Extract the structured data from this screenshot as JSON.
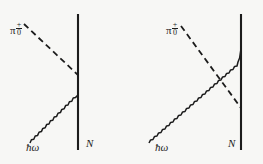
{
  "figure": {
    "background_color": "#f7f7f5",
    "ink_color": "#1c1c1c",
    "width": 263,
    "height": 164
  },
  "diagrams": [
    {
      "id": "left",
      "name": "direct-diagram",
      "labels": {
        "pion": {
          "glyph": "π",
          "charge_superscript": "+",
          "charge_subscript": "0",
          "x": 10,
          "y": 22
        },
        "photon": {
          "text": "ħω",
          "x": 26,
          "y": 142
        },
        "nucleon": {
          "text": "N",
          "x": 86,
          "y": 138
        }
      },
      "lines": {
        "nucleon_line": {
          "x": 78,
          "y1": 14,
          "y2": 150
        },
        "pion_dashed": {
          "x1": 24,
          "y1": 24,
          "x2": 78,
          "y2": 75
        },
        "photon_wavy": {
          "x1": 30,
          "y1": 143,
          "x2": 78,
          "y2": 95
        }
      },
      "vertices": [
        {
          "x": 78,
          "y": 75,
          "type": "pion-vertex"
        },
        {
          "x": 78,
          "y": 95,
          "type": "photon-vertex"
        }
      ]
    },
    {
      "id": "right",
      "name": "crossed-diagram",
      "labels": {
        "pion": {
          "glyph": "π",
          "charge_superscript": "+",
          "charge_subscript": "0",
          "x": 35,
          "y": 22
        },
        "photon": {
          "text": "ħω",
          "x": 24,
          "y": 142
        },
        "nucleon": {
          "text": "N",
          "x": 97,
          "y": 138
        }
      },
      "lines": {
        "nucleon_line": {
          "x": 110,
          "y1": 14,
          "y2": 150
        },
        "pion_dashed": {
          "x1": 50,
          "y1": 26,
          "x2": 110,
          "y2": 108
        },
        "photon_wavy": {
          "x1": 18,
          "y1": 143,
          "x2": 110,
          "y2": 46
        }
      },
      "vertices": [
        {
          "x": 110,
          "y": 46,
          "type": "photon-vertex"
        },
        {
          "x": 110,
          "y": 108,
          "type": "pion-vertex"
        }
      ],
      "crossing_point": {
        "x": 64,
        "y": 78
      }
    }
  ]
}
